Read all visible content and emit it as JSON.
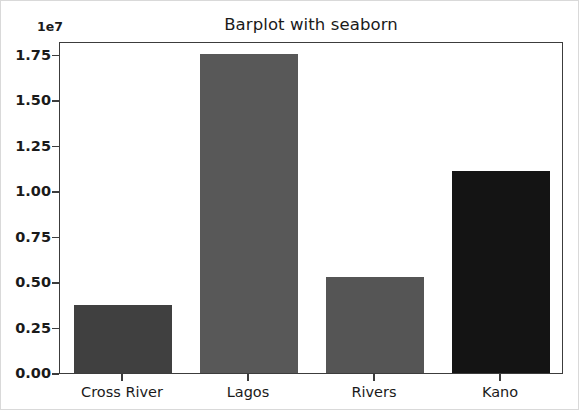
{
  "chart_data": {
    "type": "bar",
    "title": "Barplot with seaborn",
    "xlabel": "",
    "ylabel": "",
    "categories": [
      "Cross River",
      "Lagos",
      "Rivers",
      "Kano"
    ],
    "values": [
      3750000,
      17550000,
      5300000,
      11100000
    ],
    "bar_colors": [
      "#404040",
      "#585858",
      "#555555",
      "#141414"
    ],
    "ylim": [
      0,
      18250000
    ],
    "y_offset_text": "1e7",
    "y_tick_labels": [
      "0.00",
      "0.25",
      "0.50",
      "0.75",
      "1.00",
      "1.25",
      "1.50",
      "1.75"
    ],
    "y_tick_values": [
      0,
      2500000,
      5000000,
      7500000,
      10000000,
      12500000,
      15000000,
      17500000
    ],
    "grid": false,
    "legend": "none"
  },
  "style": {
    "axis_color": "#3c3c3c",
    "text_color": "#1a1a1a",
    "background": "#ffffff",
    "figure_border": "#d9d9d9"
  }
}
